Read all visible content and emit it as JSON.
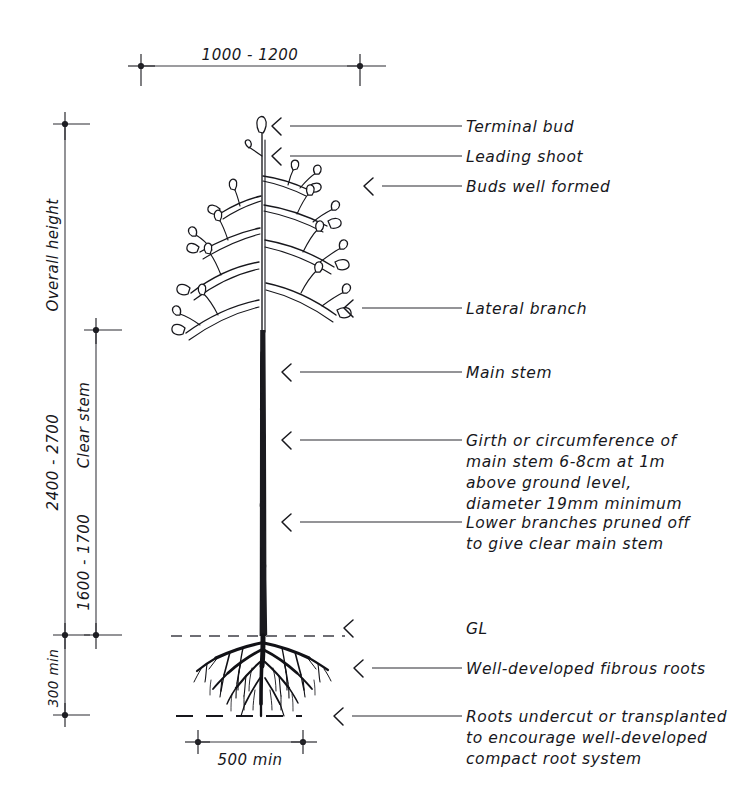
{
  "diagram": {
    "ink_color": "#17171c",
    "ground_line_color": "#6e6e74",
    "background": "#ffffff"
  },
  "dimensions": {
    "crown_width": {
      "label": "1000 - 1200",
      "orientation": "horizontal",
      "position": "top"
    },
    "overall_height_name": {
      "label": "Overall height",
      "orientation": "vertical"
    },
    "overall_height_value": {
      "label": "2400 - 2700",
      "orientation": "vertical"
    },
    "clear_stem_name": {
      "label": "Clear stem",
      "orientation": "vertical"
    },
    "clear_stem_value": {
      "label": "1600 - 1700",
      "orientation": "vertical"
    },
    "root_depth": {
      "label": "300 min",
      "orientation": "vertical"
    },
    "root_spread": {
      "label": "500 min",
      "orientation": "horizontal",
      "position": "bottom"
    }
  },
  "callouts": [
    {
      "id": "terminal-bud",
      "text": "Terminal bud"
    },
    {
      "id": "leading-shoot",
      "text": "Leading shoot"
    },
    {
      "id": "buds-well-formed",
      "text": "Buds well formed"
    },
    {
      "id": "lateral-branch",
      "text": "Lateral branch"
    },
    {
      "id": "main-stem",
      "text": "Main stem"
    },
    {
      "id": "girth",
      "lines": [
        "Girth or circumference of",
        "main stem 6-8cm at 1m",
        "above  ground level,",
        "diameter 19mm minimum"
      ]
    },
    {
      "id": "lower-branches",
      "lines": [
        "Lower branches pruned off",
        "to  give  clear main  stem"
      ]
    },
    {
      "id": "ground-level",
      "text": "GL"
    },
    {
      "id": "fibrous-roots",
      "text": "Well-developed fibrous roots"
    },
    {
      "id": "roots-undercut",
      "lines": [
        "Roots undercut or transplanted",
        "to  encourage  well-developed",
        "compact root system"
      ]
    }
  ]
}
